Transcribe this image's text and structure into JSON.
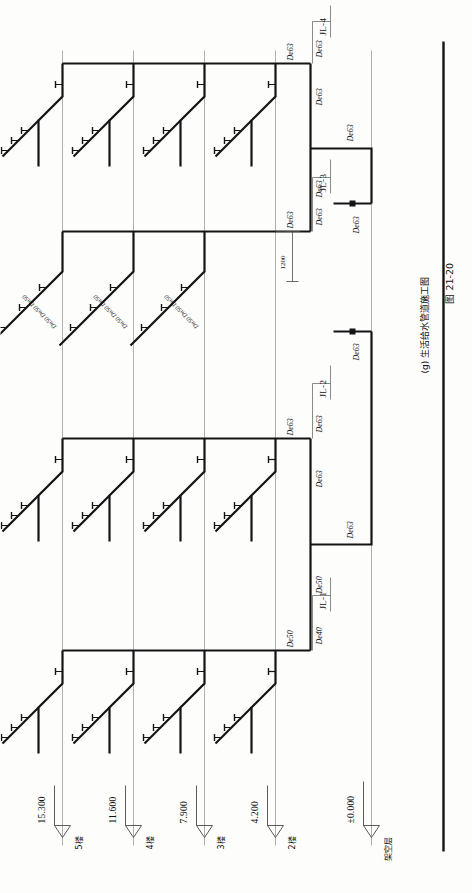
{
  "figure": {
    "caption_label": "(g) 生活给水管道施工图",
    "figure_number": "图 21-20",
    "drawing_type": "plumbing-riser-isometric",
    "line_color": "#141414",
    "grid_color": "#9a9a9a"
  },
  "levels": [
    {
      "id": "L5",
      "elevation": "15.300",
      "floor_label": "5楼"
    },
    {
      "id": "L4",
      "elevation": "11.600",
      "floor_label": "4楼"
    },
    {
      "id": "L3",
      "elevation": "7.900",
      "floor_label": "3楼"
    },
    {
      "id": "L2",
      "elevation": "4.200",
      "floor_label": "2楼"
    },
    {
      "id": "L0",
      "elevation": "±0.000",
      "floor_label": "架空层"
    }
  ],
  "risers": [
    {
      "id": "JL-1",
      "label": "JL-1"
    },
    {
      "id": "JL-2",
      "label": "JL-2"
    },
    {
      "id": "JL-3",
      "label": "JL-3"
    },
    {
      "id": "JL-4",
      "label": "JL-4"
    }
  ],
  "dimensions": [
    {
      "id": "d1",
      "value": "1200"
    }
  ],
  "pipe_labels": {
    "de63": "De63",
    "de50": "De50",
    "de40": "De40",
    "dn50": "Dn50"
  },
  "branch_label_groups": [
    {
      "id": "b1",
      "text": "Dn50 Dn50 Dn50"
    },
    {
      "id": "b2",
      "text": "Dn50 Dn50 Dn50"
    },
    {
      "id": "b3",
      "text": "Dn50 Dn50 Dn50"
    }
  ],
  "annotations": {
    "left_main_bottom": "De50",
    "left_main_upper": "De63",
    "left_riser_jl1": "De40",
    "left_riser_jl2": "De63",
    "right_main_lower": "De63",
    "right_main_upper": "De63",
    "right_riser_jl3": "De63",
    "right_riser_jl4": "De63",
    "inlet_left": "De63",
    "inlet_right": "De63",
    "cross_left": "De63",
    "cross_right": "De63"
  }
}
